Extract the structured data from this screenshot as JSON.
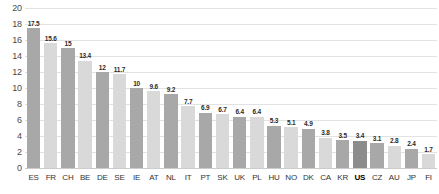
{
  "chart_data": {
    "type": "bar",
    "title": "",
    "subtitle": "",
    "xlabel": "",
    "ylabel": "",
    "ylim": [
      0,
      20
    ],
    "yticks": [
      0,
      2,
      4,
      6,
      8,
      10,
      12,
      14,
      16,
      18,
      20
    ],
    "ytick_labels": [
      "0",
      "2",
      "4",
      "6",
      "8",
      "10",
      "12",
      "14",
      "16",
      "18",
      "20"
    ],
    "grid": true,
    "legend": false,
    "legend_position": "none",
    "categories": [
      "ES",
      "FR",
      "CH",
      "BE",
      "DE",
      "SE",
      "IE",
      "AT",
      "NL",
      "IT",
      "PT",
      "SK",
      "UK",
      "PL",
      "HU",
      "NO",
      "DK",
      "CA",
      "KR",
      "US",
      "CZ",
      "AU",
      "JP",
      "FI"
    ],
    "values": [
      17.5,
      15.6,
      15,
      13.4,
      12,
      11.7,
      10,
      9.6,
      9.2,
      7.7,
      6.9,
      6.7,
      6.4,
      6.4,
      5.3,
      5.1,
      4.9,
      3.8,
      3.5,
      3.4,
      3.1,
      2.8,
      2.4,
      1.7
    ],
    "value_labels": [
      "17.5",
      "15.6",
      "15",
      "13.4",
      "12",
      "11.7",
      "10",
      "9.6",
      "9.2",
      "7.7",
      "6.9",
      "6.7",
      "6.4",
      "6.4",
      "5.3",
      "5.1",
      "4.9",
      "3.8",
      "3.5",
      "3.4",
      "3.1",
      "2.8",
      "2.4",
      "1.7"
    ],
    "highlighted_category": "US",
    "bar_styles": [
      "dark",
      "light",
      "dark",
      "light",
      "dark",
      "light",
      "dark",
      "light",
      "dark",
      "light",
      "dark",
      "light",
      "dark",
      "light",
      "dark",
      "light",
      "dark",
      "light",
      "dark",
      "highlight",
      "dark",
      "light",
      "dark",
      "light"
    ],
    "colors": {
      "bar_dark": "#a8a8a8",
      "bar_light": "#d9d9d9",
      "bar_highlight": "#8c8c8c",
      "gridline": "#e2e2e2",
      "baseline": "#cccccc",
      "axis_text": "#4a4a4a",
      "value_text": "#2b2b2b",
      "background": "#ffffff"
    }
  }
}
